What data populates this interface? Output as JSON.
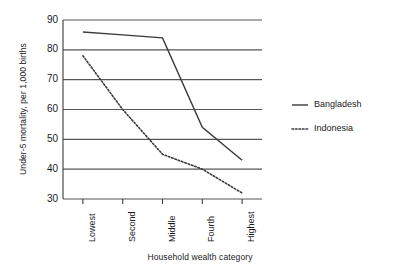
{
  "chart_data": {
    "type": "line",
    "title": "",
    "xlabel": "Household wealth category",
    "ylabel": "Under-5 mortality, per 1,000 births",
    "categories": [
      "Lowest",
      "Second",
      "Middle",
      "Fourth",
      "Highest"
    ],
    "series": [
      {
        "name": "Bangladesh",
        "style": "solid",
        "color": "#3a3a3a",
        "values": [
          86,
          85,
          84,
          54,
          43
        ]
      },
      {
        "name": "Indonesia",
        "style": "dotted",
        "color": "#3a3a3a",
        "values": [
          78,
          60,
          45,
          40,
          32
        ]
      }
    ],
    "ylim": [
      30,
      90
    ],
    "yticks": [
      90,
      80,
      70,
      60,
      50,
      40,
      30
    ],
    "ytick_labels": [
      "90",
      "80",
      "70",
      "60",
      "50",
      "40",
      "30"
    ],
    "grid": true,
    "grid_axis": "y",
    "legend_position": "right"
  },
  "legend": {
    "entries": [
      {
        "label": "Bangladesh"
      },
      {
        "label": "Indonesia"
      }
    ]
  }
}
